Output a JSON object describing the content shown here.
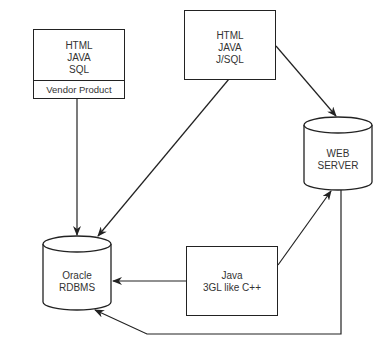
{
  "diagram": {
    "nodes": {
      "vendor_box": {
        "lines": [
          "HTML",
          "JAVA",
          "SQL"
        ],
        "footer": "Vendor Product"
      },
      "jsql_box": {
        "lines": [
          "HTML",
          "JAVA",
          "J/SQL"
        ]
      },
      "web_server": {
        "lines": [
          "WEB",
          "SERVER"
        ],
        "shape": "cylinder"
      },
      "oracle_db": {
        "lines": [
          "Oracle",
          "RDBMS"
        ],
        "shape": "cylinder"
      },
      "java_box": {
        "lines": [
          "Java",
          "3GL like C++"
        ]
      }
    },
    "edges": [
      {
        "from": "vendor_box",
        "to": "oracle_db"
      },
      {
        "from": "jsql_box",
        "to": "oracle_db"
      },
      {
        "from": "jsql_box",
        "to": "web_server"
      },
      {
        "from": "java_box",
        "to": "web_server"
      },
      {
        "from": "java_box",
        "to": "oracle_db"
      },
      {
        "from": "web_server",
        "to": "oracle_db"
      }
    ],
    "colors": {
      "stroke": "#222222",
      "text": "#333333",
      "background": "#ffffff"
    }
  }
}
